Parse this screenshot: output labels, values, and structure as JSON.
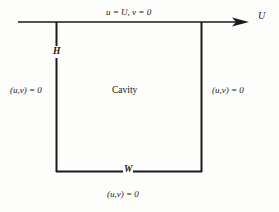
{
  "figure": {
    "name": "lid-driven-cavity-schematic",
    "background_color": "#fdfdfc",
    "line_color": "#1a1a1a"
  },
  "diagram": {
    "region_label": "Cavity",
    "top_boundary_condition": "u = U, v = 0",
    "left_boundary_condition": "(u,v) = 0",
    "right_boundary_condition": "(u,v) = 0",
    "bottom_boundary_condition": "(u,v) = 0",
    "height_label": "H",
    "width_label": "W",
    "velocity_label": "U",
    "icons": {
      "arrow": "right-arrow-icon"
    }
  }
}
